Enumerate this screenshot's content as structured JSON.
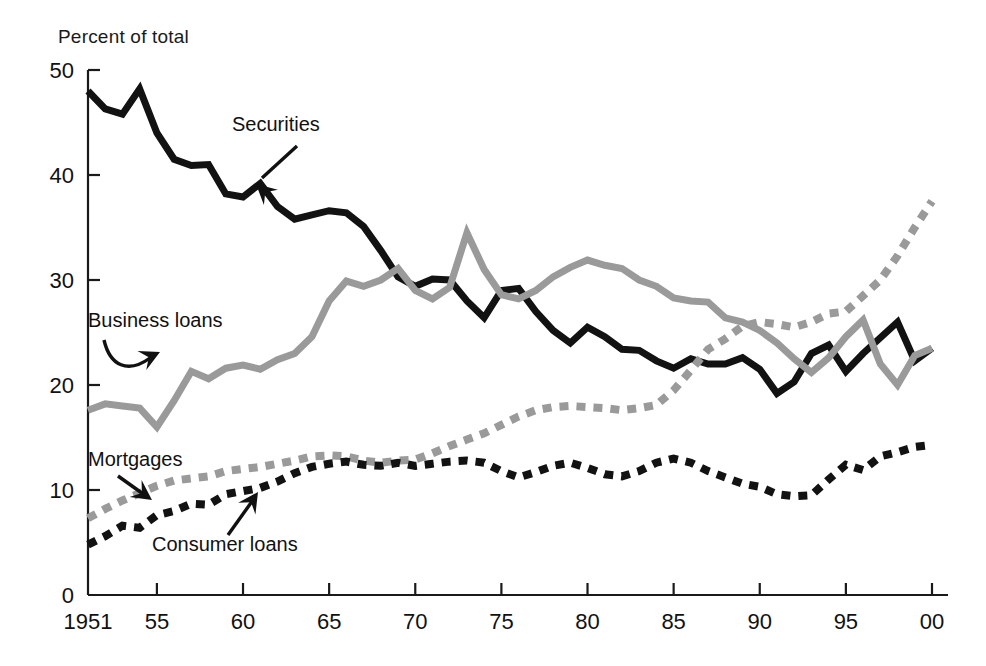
{
  "chart_data": {
    "type": "line",
    "title": "",
    "subtitle": "",
    "ylabel": "Percent of total",
    "xlabel": "",
    "ylim": [
      0,
      50
    ],
    "xlim": [
      1951,
      2000
    ],
    "grid": false,
    "legend_position": "inline-annotations",
    "y_ticks": [
      "0",
      "10",
      "20",
      "30",
      "40",
      "50"
    ],
    "y_tick_values": [
      0,
      10,
      20,
      30,
      40,
      50
    ],
    "x_ticks": [
      "1951",
      "55",
      "60",
      "65",
      "70",
      "75",
      "80",
      "85",
      "90",
      "95",
      "00"
    ],
    "x_tick_values": [
      1951,
      1955,
      1960,
      1965,
      1970,
      1975,
      1980,
      1985,
      1990,
      1995,
      2000
    ],
    "x": [
      1951,
      1952,
      1953,
      1954,
      1955,
      1956,
      1957,
      1958,
      1959,
      1960,
      1961,
      1962,
      1963,
      1964,
      1965,
      1966,
      1967,
      1968,
      1969,
      1970,
      1971,
      1972,
      1973,
      1974,
      1975,
      1976,
      1977,
      1978,
      1979,
      1980,
      1981,
      1982,
      1983,
      1984,
      1985,
      1986,
      1987,
      1988,
      1989,
      1990,
      1991,
      1992,
      1993,
      1994,
      1995,
      1996,
      1997,
      1998,
      1999,
      2000
    ],
    "series": [
      {
        "name": "Securities",
        "style": "solid",
        "color": "#121212",
        "width": 7,
        "values": [
          48.0,
          46.3,
          45.8,
          48.2,
          44.0,
          41.5,
          40.9,
          41.0,
          38.2,
          37.9,
          39.2,
          37.0,
          35.8,
          36.2,
          36.6,
          36.4,
          35.1,
          32.8,
          30.3,
          29.4,
          30.1,
          30.0,
          28.0,
          26.4,
          29.0,
          29.2,
          27.0,
          25.2,
          24.0,
          25.5,
          24.6,
          23.4,
          23.3,
          22.3,
          21.6,
          22.5,
          22.0,
          22.0,
          22.6,
          21.5,
          19.2,
          20.3,
          23.0,
          23.8,
          21.3,
          23.0,
          24.5,
          26.0,
          22.3,
          23.5
        ]
      },
      {
        "name": "Business loans",
        "style": "solid",
        "color": "#9a9a9a",
        "width": 7,
        "values": [
          17.6,
          18.2,
          18.0,
          17.8,
          16.0,
          18.5,
          21.3,
          20.6,
          21.6,
          21.9,
          21.5,
          22.4,
          23.0,
          24.6,
          28.0,
          29.9,
          29.4,
          30.0,
          31.1,
          29.0,
          28.2,
          29.3,
          34.5,
          31.0,
          28.6,
          28.2,
          29.0,
          30.3,
          31.2,
          31.9,
          31.4,
          31.1,
          30.0,
          29.4,
          28.3,
          28.0,
          27.9,
          26.4,
          26.0,
          25.2,
          24.0,
          22.5,
          21.2,
          22.6,
          24.6,
          26.2,
          22.0,
          20.0,
          22.8,
          23.5
        ]
      },
      {
        "name": "Mortgages",
        "style": "dashed",
        "color": "#9a9a9a",
        "width": 8,
        "values": [
          7.3,
          8.2,
          9.0,
          9.7,
          10.4,
          10.9,
          11.1,
          11.3,
          11.8,
          12.0,
          12.2,
          12.5,
          12.8,
          13.2,
          13.3,
          13.2,
          12.8,
          12.6,
          12.8,
          12.9,
          13.5,
          14.2,
          14.8,
          15.4,
          16.2,
          17.0,
          17.6,
          17.9,
          18.0,
          17.9,
          17.8,
          17.6,
          17.8,
          18.1,
          19.5,
          21.4,
          23.4,
          24.4,
          25.6,
          26.0,
          25.8,
          25.5,
          26.0,
          26.8,
          27.0,
          28.5,
          30.0,
          32.3,
          35.0,
          37.5
        ]
      },
      {
        "name": "Consumer loans",
        "style": "dashed",
        "color": "#121212",
        "width": 8,
        "values": [
          4.8,
          5.6,
          6.6,
          6.4,
          7.6,
          8.0,
          8.7,
          8.6,
          9.6,
          9.9,
          10.2,
          10.8,
          11.6,
          12.2,
          12.5,
          12.7,
          12.4,
          12.3,
          12.6,
          12.3,
          12.5,
          12.7,
          12.8,
          12.6,
          11.8,
          11.2,
          11.7,
          12.3,
          12.6,
          12.1,
          11.5,
          11.3,
          11.8,
          12.6,
          13.0,
          12.6,
          11.8,
          11.2,
          10.6,
          10.3,
          9.6,
          9.4,
          9.5,
          11.0,
          12.4,
          11.9,
          13.2,
          13.6,
          14.1,
          14.3
        ]
      }
    ],
    "annotations": [
      {
        "text": "Securities",
        "target_series": "Securities",
        "x_label": 1963,
        "y_label": 44
      },
      {
        "text": "Business loans",
        "target_series": "Business loans",
        "x_label": 1953,
        "y_label": 27
      },
      {
        "text": "Mortgages",
        "target_series": "Mortgages",
        "x_label": 1953,
        "y_label": 13
      },
      {
        "text": "Consumer loans",
        "target_series": "Consumer loans",
        "x_label": 1957,
        "y_label": 3
      }
    ]
  }
}
